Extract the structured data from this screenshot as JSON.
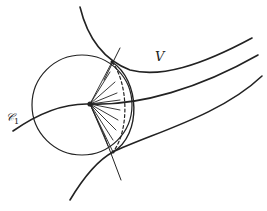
{
  "figure": {
    "labels": {
      "v": "V",
      "c1_main": "𝒞",
      "c1_sub": "1"
    },
    "colors": {
      "stroke": "#222222",
      "background": "#ffffff"
    },
    "elements": {
      "circle": {
        "cx": 82,
        "cy": 105,
        "r": 50
      },
      "focal_point": {
        "x": 90,
        "y": 104
      },
      "lens_top": {
        "x": 112,
        "y": 62
      },
      "lens_bottom": {
        "x": 113,
        "y": 152
      },
      "ray_count": 11
    }
  }
}
